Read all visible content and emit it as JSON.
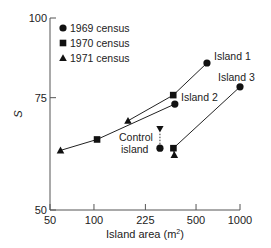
{
  "chart_data": {
    "type": "line",
    "title": "",
    "xlabel": "Island area (m²)",
    "xlabel_base": "Island area (m",
    "xlabel_sup": "2",
    "xlabel_tail": ")",
    "ylabel": "S",
    "xscale": "log",
    "yscale": "log",
    "xlim": [
      50,
      1000
    ],
    "ylim": [
      50,
      100
    ],
    "xticks": [
      50,
      100,
      225,
      500,
      1000
    ],
    "xtick_labels": [
      "50",
      "100",
      "225",
      "500",
      "1000"
    ],
    "yticks": [
      50,
      75,
      100
    ],
    "ytick_labels": [
      "50",
      "75",
      "100"
    ],
    "grid": false,
    "legend_position": "upper-left",
    "legend": [
      {
        "marker": "circle",
        "label": "1969 census"
      },
      {
        "marker": "square",
        "label": "1970 census"
      },
      {
        "marker": "triangle",
        "label": "1971 census"
      }
    ],
    "series": [
      {
        "name": "Island 1",
        "points": [
          {
            "census": "1971",
            "marker": "triangle",
            "x": 171,
            "y": 69
          },
          {
            "census": "1970",
            "marker": "square",
            "x": 349,
            "y": 75.7
          },
          {
            "census": "1969",
            "marker": "circle",
            "x": 594,
            "y": 85
          }
        ]
      },
      {
        "name": "Island 2",
        "points": [
          {
            "census": "1971",
            "marker": "triangle",
            "x": 59,
            "y": 62
          },
          {
            "census": "1970",
            "marker": "square",
            "x": 105,
            "y": 64.5
          },
          {
            "census": "1969",
            "marker": "circle",
            "x": 358,
            "y": 73.3
          }
        ]
      },
      {
        "name": "Island 3",
        "points": [
          {
            "census": "1971",
            "marker": "triangle",
            "x": 355,
            "y": 61
          },
          {
            "census": "1970",
            "marker": "square",
            "x": 350,
            "y": 62.5
          },
          {
            "census": "1969",
            "marker": "circle",
            "x": 1000,
            "y": 78
          }
        ]
      },
      {
        "name": "Control island",
        "points": [
          {
            "census": "1969",
            "marker": "circle",
            "x": 283,
            "y": 62.5
          },
          {
            "census": "1971",
            "marker": "triangle-down",
            "x": 283,
            "y": 67
          }
        ]
      }
    ],
    "annotations": [
      "Island 1",
      "Island 2",
      "Island 3",
      "Control",
      "island"
    ]
  }
}
